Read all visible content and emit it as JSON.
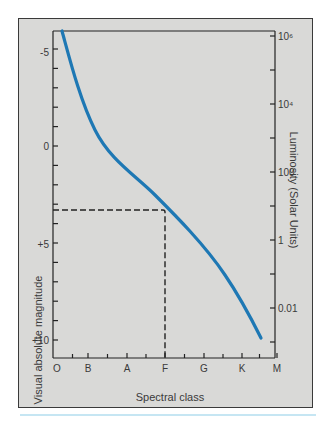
{
  "chart_data": {
    "type": "line",
    "title": "",
    "xlabel": "Spectral class",
    "ylabel": "Visual absolute magnitude",
    "ylabel_right": "Luminosity (Solar Units)",
    "x_categories": [
      "O",
      "B",
      "A",
      "F",
      "G",
      "K",
      "M"
    ],
    "y_ticks_left": [
      "-5",
      "0",
      "+5",
      "+10"
    ],
    "y_ticks_right": [
      "10⁶",
      "10⁴",
      "100",
      "1",
      "0.01"
    ],
    "ylim_left": [
      -6.1,
      11.0
    ],
    "y_inverted": true,
    "series": [
      {
        "name": "Main sequence",
        "color": "#1e78b4",
        "x": [
          0.1,
          0.5,
          1.0,
          1.5,
          2.0,
          2.5,
          3.0,
          3.5,
          4.0,
          4.5,
          5.0,
          5.5,
          5.8
        ],
        "y": [
          -6.0,
          -3.5,
          -1.0,
          0.6,
          1.6,
          2.4,
          3.3,
          4.3,
          5.3,
          6.4,
          7.7,
          9.3,
          10.0
        ]
      }
    ],
    "annotations": [
      {
        "type": "dashed-guide",
        "y_magnitude": 3.3,
        "x_class": "F",
        "color": "#222222"
      }
    ],
    "grid": false,
    "legend": "none"
  },
  "labels": {
    "xlabel": "Spectral class",
    "ylabel_left": "Visual absolute magnitude",
    "ylabel_right": "Luminosity (Solar Units)"
  },
  "axis": {
    "left": [
      {
        "label": "-5",
        "y": 52
      },
      {
        "label": "0",
        "y": 146
      },
      {
        "label": "+5",
        "y": 244
      },
      {
        "label": "+10",
        "y": 340
      }
    ],
    "right": [
      {
        "label": "10⁶",
        "y": 36
      },
      {
        "label": "10⁴",
        "y": 104
      },
      {
        "label": "100",
        "y": 172
      },
      {
        "label": "1",
        "y": 240
      },
      {
        "label": "0.01",
        "y": 308
      }
    ],
    "bottom": [
      {
        "label": "O",
        "x": 57
      },
      {
        "label": "B",
        "x": 88
      },
      {
        "label": "A",
        "x": 127
      },
      {
        "label": "F",
        "x": 165
      },
      {
        "label": "G",
        "x": 204
      },
      {
        "label": "K",
        "x": 242
      },
      {
        "label": "M",
        "x": 277
      }
    ]
  },
  "colors": {
    "curve": "#1e78b4",
    "frame_bg": "#d9d9d7",
    "rule": "#c6e6f3",
    "axis": "#222222"
  }
}
